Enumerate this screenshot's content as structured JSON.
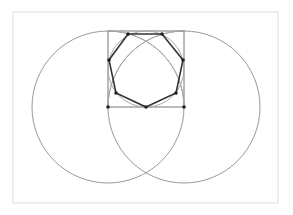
{
  "diagram": {
    "frame": {
      "x": 13,
      "y": 12,
      "width": 265,
      "height": 191,
      "stroke": "#dddddd"
    },
    "large_circles": [
      {
        "cx": 108,
        "cy": 107,
        "r": 76,
        "stroke": "#999999"
      },
      {
        "cx": 184,
        "cy": 107,
        "r": 76,
        "stroke": "#999999"
      }
    ],
    "square": {
      "x": 108,
      "y": 31,
      "width": 76,
      "height": 76,
      "stroke": "#777777"
    },
    "inscribed_circle": {
      "cx": 146,
      "cy": 69,
      "r": 38,
      "stroke": "#aaaaaa"
    },
    "heptagon": {
      "points": [
        [
          146,
          107
        ],
        [
          176,
          93
        ],
        [
          183,
          60
        ],
        [
          162,
          34
        ],
        [
          128,
          34
        ],
        [
          109,
          60
        ],
        [
          116,
          93
        ]
      ],
      "stroke": "#333333"
    },
    "square_points": [
      [
        108,
        107
      ],
      [
        184,
        107
      ]
    ],
    "point_color": "#222222"
  }
}
